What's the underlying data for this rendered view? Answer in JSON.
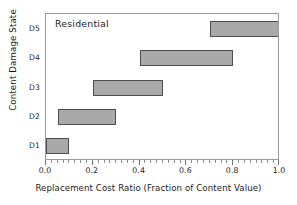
{
  "chart_data": {
    "type": "bar",
    "orientation": "horizontal",
    "subtype": "range-bar",
    "title": "",
    "annotation": "Residential",
    "xlabel": "Replacement Cost Ratio (Fraction of Content Value)",
    "ylabel": "Content Damage State",
    "categories": [
      "D1",
      "D2",
      "D3",
      "D4",
      "D5"
    ],
    "ranges": [
      {
        "category": "D1",
        "start": 0.0,
        "end": 0.1
      },
      {
        "category": "D2",
        "start": 0.05,
        "end": 0.3
      },
      {
        "category": "D3",
        "start": 0.2,
        "end": 0.5
      },
      {
        "category": "D4",
        "start": 0.4,
        "end": 0.8
      },
      {
        "category": "D5",
        "start": 0.7,
        "end": 1.0
      }
    ],
    "xlim": [
      0.0,
      1.0
    ],
    "x_tick_labels": [
      "0.0",
      "0.2",
      "0.4",
      "0.6",
      "0.8",
      "1.0"
    ],
    "x_tick_values": [
      0.0,
      0.2,
      0.4,
      0.6,
      0.8,
      1.0
    ],
    "x_minor_tick_step": 0.025,
    "y_tick_labels": [
      "D1",
      "D2",
      "D3",
      "D4",
      "D5"
    ],
    "grid": false,
    "legend": false,
    "bar_fill_color": "#a9a9a9",
    "bar_border_color": "#4d4d4d",
    "frame_color": "#9a9a9a",
    "background_color": "#ffffff"
  }
}
